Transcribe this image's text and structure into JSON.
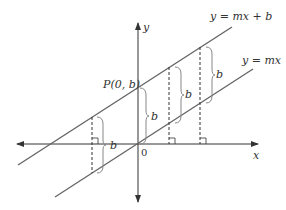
{
  "diagram": {
    "type": "coordinate-geometry",
    "axes": {
      "x_label": "x",
      "y_label": "y",
      "origin_label": "0"
    },
    "lines": [
      {
        "id": "line-mx-plus-b",
        "label": "y = mx + b"
      },
      {
        "id": "line-mx",
        "label": "y = mx"
      }
    ],
    "point": {
      "label": "P(0, b)"
    },
    "distance_label": "b",
    "segments": [
      {
        "label": "b",
        "position": "left of y-axis"
      },
      {
        "label": "b",
        "position": "on y-axis"
      },
      {
        "label": "b",
        "position": "first right of y-axis"
      },
      {
        "label": "b",
        "position": "second right of y-axis"
      }
    ],
    "colors": {
      "axis": "#333333",
      "line": "#666666",
      "brace": "#888888",
      "dashed": "#333333"
    }
  }
}
